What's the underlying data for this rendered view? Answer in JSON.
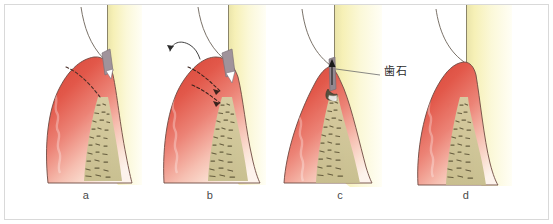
{
  "figure": {
    "type": "medical-illustration",
    "panel_count": 4,
    "border_color": "#d9d9d9",
    "background_color": "#ffffff"
  },
  "panels": [
    {
      "id": "a",
      "label": "a",
      "description": "gingiva with dashed incision line along pocket wall and probe in sulcus"
    },
    {
      "id": "b",
      "label": "b",
      "description": "gingiva reflected with curved arrow and dashed directional arrows"
    },
    {
      "id": "c",
      "label": "c",
      "description": "receded gingiva exposing calculus on root surface with upward arrow"
    },
    {
      "id": "d",
      "label": "d",
      "description": "healed gingiva re-adapted to tooth surface"
    }
  ],
  "annotations": {
    "calculus": {
      "text": "歯石",
      "panel": "c"
    }
  },
  "colors": {
    "gingiva_dark": "#d84a3c",
    "gingiva_mid": "#e8776a",
    "gingiva_light": "#f6c9bd",
    "gingiva_pale": "#fcefe8",
    "tooth_enamel": "#f7f3bd",
    "tooth_pale": "#fdfbe8",
    "bone_khaki": "#cfc79a",
    "bone_outline": "#6e6545",
    "outline": "#5b4a42",
    "instrument_gray": "#9a8f96",
    "leader_line": "#6b6b6b",
    "label_text": "#4a4a4a"
  }
}
